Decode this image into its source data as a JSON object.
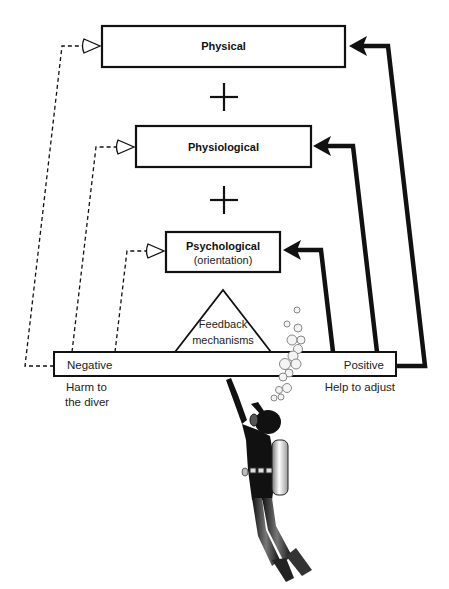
{
  "diagram": {
    "title": "",
    "levels": [
      {
        "id": "physical",
        "label": "Physical",
        "sublabel": ""
      },
      {
        "id": "physiological",
        "label": "Physiological",
        "sublabel": ""
      },
      {
        "id": "psychological",
        "label": "Psychological",
        "sublabel": "(orientation)"
      }
    ],
    "operators": [
      "+",
      "+"
    ],
    "feedback": {
      "line1": "Feedback",
      "line2": "mechanisms"
    },
    "bar": {
      "left_label": "Negative",
      "right_label": "Positive"
    },
    "outcomes": {
      "negative_line1": "Harm to",
      "negative_line2": "the diver",
      "positive": "Help to adjust"
    },
    "colors": {
      "stroke": "#111111",
      "background": "#ffffff",
      "bubble": "#cfcfcf"
    },
    "illustration": "scuba-diver-icon"
  }
}
